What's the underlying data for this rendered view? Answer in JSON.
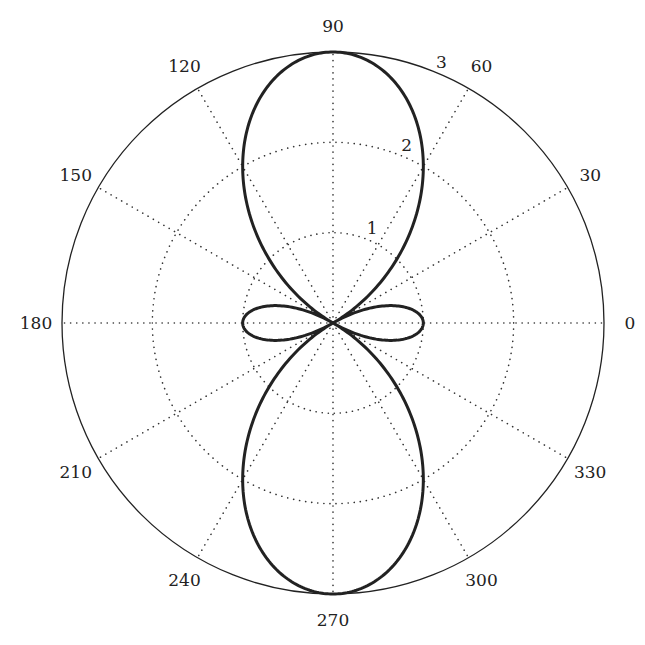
{
  "chart_data": {
    "type": "line",
    "subtype": "polar",
    "title": "",
    "equation": "r = 1 - 2cos(2θ)",
    "angle_ticks": [
      "0",
      "30",
      "60",
      "90",
      "120",
      "150",
      "180",
      "210",
      "240",
      "270",
      "300",
      "330"
    ],
    "angle_tick_values": [
      0,
      30,
      60,
      90,
      120,
      150,
      180,
      210,
      240,
      270,
      300,
      330
    ],
    "radial_ticks": [
      "1",
      "2",
      "3"
    ],
    "radial_tick_values": [
      1,
      2,
      3
    ],
    "rlim": [
      0,
      3
    ],
    "grid": true,
    "series": [
      {
        "name": "r(θ)",
        "theta_deg": [
          0,
          15,
          30,
          45,
          60,
          75,
          90,
          105,
          120,
          135,
          150,
          165,
          180,
          195,
          210,
          225,
          240,
          255,
          270,
          285,
          300,
          315,
          330,
          345,
          360
        ],
        "r": [
          -1,
          -0.732,
          0,
          1,
          2,
          2.732,
          3,
          2.732,
          2,
          1,
          0,
          -0.732,
          -1,
          -0.732,
          0,
          1,
          2,
          2.732,
          3,
          2.732,
          2,
          1,
          0,
          -0.732,
          -1
        ]
      }
    ],
    "colors": {
      "curve": "#222222",
      "grid": "#333333",
      "axis": "#222222"
    }
  }
}
